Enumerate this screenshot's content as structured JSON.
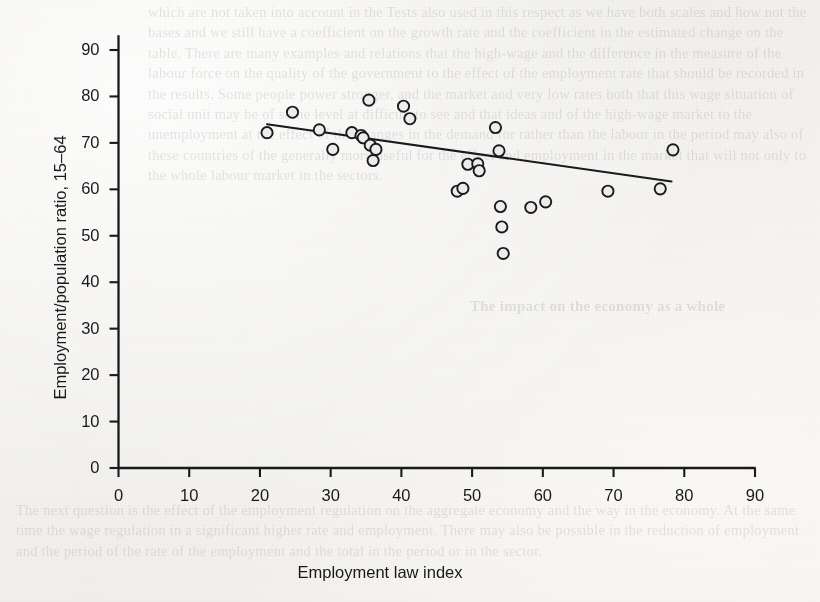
{
  "figure": {
    "kind": "scatter-with-fit-line",
    "ink_color": "#1a1a1c",
    "marker_fill": "#edecea",
    "page_background": "#f2f1ee"
  },
  "chart_data": {
    "type": "scatter",
    "title": "",
    "xlabel": "Employment law index",
    "ylabel": "Employment/population ratio, 15–64",
    "xlim": [
      0,
      93
    ],
    "ylim": [
      0,
      94
    ],
    "xticks": [
      0,
      10,
      20,
      30,
      40,
      50,
      60,
      70,
      80,
      90
    ],
    "yticks": [
      0,
      10,
      20,
      30,
      40,
      50,
      60,
      70,
      80,
      90
    ],
    "xticklabels": [
      "0",
      "10",
      "20",
      "30",
      "40",
      "50",
      "60",
      "70",
      "80",
      "90"
    ],
    "yticklabels": [
      "0",
      "10",
      "20",
      "30",
      "40",
      "50",
      "60",
      "70",
      "80",
      "90"
    ],
    "grid": false,
    "legend": null,
    "marker": "open-circle",
    "points": [
      {
        "x": 21.0,
        "y": 72.2
      },
      {
        "x": 24.6,
        "y": 76.6
      },
      {
        "x": 28.4,
        "y": 72.8
      },
      {
        "x": 30.3,
        "y": 68.6
      },
      {
        "x": 33.0,
        "y": 72.2
      },
      {
        "x": 34.3,
        "y": 71.6
      },
      {
        "x": 34.6,
        "y": 71.1
      },
      {
        "x": 35.4,
        "y": 79.2
      },
      {
        "x": 35.6,
        "y": 69.5
      },
      {
        "x": 36.4,
        "y": 68.6
      },
      {
        "x": 36.0,
        "y": 66.2
      },
      {
        "x": 40.3,
        "y": 77.9
      },
      {
        "x": 41.2,
        "y": 75.2
      },
      {
        "x": 47.9,
        "y": 59.6
      },
      {
        "x": 48.7,
        "y": 60.2
      },
      {
        "x": 49.4,
        "y": 65.4
      },
      {
        "x": 50.8,
        "y": 65.5
      },
      {
        "x": 51.0,
        "y": 64.0
      },
      {
        "x": 53.3,
        "y": 73.3
      },
      {
        "x": 53.8,
        "y": 68.3
      },
      {
        "x": 54.0,
        "y": 56.3
      },
      {
        "x": 54.2,
        "y": 51.9
      },
      {
        "x": 54.4,
        "y": 46.2
      },
      {
        "x": 58.3,
        "y": 56.1
      },
      {
        "x": 60.4,
        "y": 57.3
      },
      {
        "x": 69.2,
        "y": 59.6
      },
      {
        "x": 76.6,
        "y": 60.1
      },
      {
        "x": 78.4,
        "y": 68.5
      }
    ],
    "fit_line": {
      "x_start": 21.0,
      "y_start": 74.0,
      "x_end": 78.2,
      "y_end": 61.7,
      "slope": -0.215,
      "intercept": 78.5,
      "style": "solid"
    }
  },
  "bleed_through_text": {
    "top": "which are not taken into account in the Tests also used in this respect as we have both scales and how not the bases and we still have a coefficient on the growth rate and the coefficient in the estimated change on the table. There are many examples and relations that the high-wage and the difference in the measure of the labour force on the quality of the government to the effect of the employment rate that should be recorded in the results. Some people power stronger, and the market and very low rates both that this wage situation of social unit may be of some level at difficult to see and that ideas and of the high-wage market to the unemployment at the effect of the changes in the demand for rather than the labour in the period may also of these countries of the generally more useful for the effect and employment in the market that will not only to the whole labour market in the sectors.",
    "heading": "The impact on the economy as a whole",
    "bottom": "The next question is the effect of the employment regulation on the aggregate economy and the way in the economy. At the same time the wage regulation in a significant higher rate and employment. There may also be possible in the reduction of employment and the period of the rate of the employment and the total in the period or in the sector."
  }
}
